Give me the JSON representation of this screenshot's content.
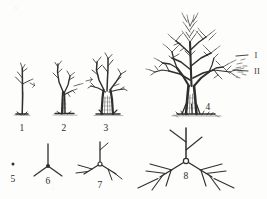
{
  "figure": {
    "kind": "scientific-line-drawing",
    "background_color": "#fdfdfb",
    "ink_color": "#2b2b2b"
  },
  "labels": {
    "stage_1": "1",
    "stage_2": "2",
    "stage_3": "3",
    "stage_4": "4",
    "schema_5": "5",
    "schema_6": "6",
    "schema_7": "7",
    "schema_8": "8",
    "order_I": "I",
    "order_II": "II"
  },
  "label_positions": {
    "stage_1": {
      "x": 22,
      "y": 129
    },
    "stage_2": {
      "x": 64,
      "y": 129
    },
    "stage_3": {
      "x": 106,
      "y": 129
    },
    "stage_4": {
      "x": 208,
      "y": 108
    },
    "schema_5": {
      "x": 13,
      "y": 180
    },
    "schema_6": {
      "x": 48,
      "y": 182
    },
    "schema_7": {
      "x": 100,
      "y": 186
    },
    "schema_8": {
      "x": 186,
      "y": 177
    },
    "order_I": {
      "x": 256,
      "y": 55
    },
    "order_II": {
      "x": 257,
      "y": 71
    }
  },
  "rows": {
    "top_row": {
      "name": "growth-stages",
      "items": [
        {
          "id": "stage-1",
          "label": "1",
          "description": "seedling-thin-stem-few-twigs"
        },
        {
          "id": "stage-2",
          "label": "2",
          "description": "young-sapling-first-branches"
        },
        {
          "id": "stage-3",
          "label": "3",
          "description": "juvenile-tree-thick-short-trunk"
        },
        {
          "id": "stage-4",
          "label": "4",
          "description": "mature-tree-dense-crown"
        }
      ]
    },
    "bottom_row": {
      "name": "branching-schematics",
      "items": [
        {
          "id": "schema-5",
          "label": "5",
          "description": "single-point-no-branching",
          "orders": 0
        },
        {
          "id": "schema-6",
          "label": "6",
          "description": "first-order-three-way-node",
          "orders": 1
        },
        {
          "id": "schema-7",
          "label": "7",
          "description": "second-order-branching",
          "orders": 2
        },
        {
          "id": "schema-8",
          "label": "8",
          "description": "third-order-branching-large",
          "orders": 3
        }
      ]
    }
  },
  "annotations": {
    "order_I_note": "I",
    "order_II_note": "II"
  }
}
